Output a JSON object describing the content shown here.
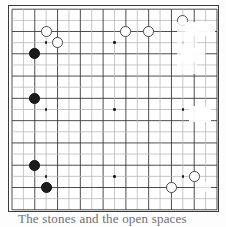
{
  "diagram": {
    "kind": "go-board-diagram",
    "caption_text": "The stones and the open spaces",
    "board": {
      "size": 19,
      "columns": 19,
      "rows": 19,
      "line_color_major": "#3a3a3a",
      "line_color_minor": "#b9b9b9",
      "board_color": "#ffffff",
      "border_color": "#3a3a3a",
      "star_point_color": "#1b1b1b",
      "star_points": [
        {
          "col": 4,
          "row": 4
        },
        {
          "col": 10,
          "row": 4
        },
        {
          "col": 16,
          "row": 4
        },
        {
          "col": 4,
          "row": 10
        },
        {
          "col": 10,
          "row": 10
        },
        {
          "col": 16,
          "row": 10
        },
        {
          "col": 4,
          "row": 16
        },
        {
          "col": 10,
          "row": 16
        },
        {
          "col": 16,
          "row": 16
        }
      ]
    },
    "stones": {
      "black_color": "#1b1b1b",
      "white_color": "#ffffff",
      "white_outline_color": "#4a4a4a",
      "black_count": 4,
      "white_count": 7,
      "items": [
        {
          "color": "white",
          "col": 4,
          "row": 3,
          "label": "white-stone-d17"
        },
        {
          "color": "white",
          "col": 5,
          "row": 4,
          "label": "white-stone-e16"
        },
        {
          "color": "white",
          "col": 11,
          "row": 3,
          "label": "white-stone-k17"
        },
        {
          "color": "white",
          "col": 13,
          "row": 3,
          "label": "white-stone-m17"
        },
        {
          "color": "white",
          "col": 16,
          "row": 2,
          "label": "white-stone-p18"
        },
        {
          "color": "black",
          "col": 3,
          "row": 5,
          "label": "black-stone-c15"
        },
        {
          "color": "black",
          "col": 3,
          "row": 9,
          "label": "black-stone-c11"
        },
        {
          "color": "black",
          "col": 3,
          "row": 15,
          "label": "black-stone-c5"
        },
        {
          "color": "black",
          "col": 4,
          "row": 17,
          "label": "black-stone-d3"
        },
        {
          "color": "white",
          "col": 15,
          "row": 17,
          "label": "white-stone-o3"
        },
        {
          "color": "white",
          "col": 17,
          "row": 16,
          "label": "white-stone-q4"
        }
      ]
    },
    "faded_regions": [
      {
        "name": "upper-right-wash",
        "x": 168,
        "y": 16,
        "w": 20,
        "h": 52,
        "strength": "soft"
      },
      {
        "name": "upper-right-wash-2",
        "x": 176,
        "y": 16,
        "w": 30,
        "h": 14,
        "strength": "hard"
      },
      {
        "name": "mid-right-wash",
        "x": 172,
        "y": 42,
        "w": 24,
        "h": 14,
        "strength": "hard"
      },
      {
        "name": "center-right-wash",
        "x": 180,
        "y": 100,
        "w": 22,
        "h": 16,
        "strength": "hard"
      },
      {
        "name": "lower-right-wash",
        "x": 186,
        "y": 176,
        "w": 16,
        "h": 10,
        "strength": "soft"
      }
    ]
  }
}
